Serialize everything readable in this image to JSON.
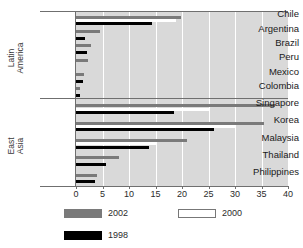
{
  "figure": {
    "title_remnant": "",
    "background": "#ffffff",
    "plot_background": "#d9d9d9"
  },
  "chart_data": {
    "type": "bar",
    "orientation": "horizontal",
    "title": "",
    "xlabel": "",
    "ylabel": "",
    "xlim": [
      0,
      40
    ],
    "xticks": [
      0,
      5,
      10,
      15,
      20,
      25,
      30,
      35,
      40
    ],
    "grid": true,
    "grid_axis": "x",
    "legend_position": "below",
    "groups": [
      {
        "name": "Latin America",
        "categories": [
          "Chile",
          "Argentina",
          "Brazil",
          "Peru",
          "Mexico",
          "Colombia"
        ]
      },
      {
        "name": "East Asia",
        "categories": [
          "Singapore",
          "Korea",
          "Malaysia",
          "Thailand",
          "Philippines"
        ]
      }
    ],
    "categories": [
      "Chile",
      "Argentina",
      "Brazil",
      "Peru",
      "Mexico",
      "Colombia",
      "Singapore",
      "Korea",
      "Malaysia",
      "Thailand",
      "Philippines"
    ],
    "series": [
      {
        "name": "2002",
        "color": "#7a7a7a",
        "values": [
          19.8,
          4.6,
          2.8,
          2.2,
          1.5,
          0.8,
          37.5,
          35.5,
          21.0,
          8.2,
          4.0
        ]
      },
      {
        "name": "2000",
        "color": "#ffffff",
        "values": [
          18.9,
          0.0,
          0.0,
          0.0,
          0.0,
          0.0,
          25.0,
          30.0,
          15.0,
          0.0,
          0.0
        ]
      },
      {
        "name": "1998",
        "color": "#000000",
        "values": [
          14.4,
          1.7,
          2.1,
          0.0,
          1.3,
          0.7,
          18.5,
          26.0,
          13.7,
          5.7,
          3.5
        ]
      }
    ]
  },
  "legend": {
    "items": [
      {
        "label": "2002",
        "swatch": "s2002"
      },
      {
        "label": "2000",
        "swatch": "s2000"
      },
      {
        "label": "1998",
        "swatch": "s1998"
      }
    ]
  }
}
